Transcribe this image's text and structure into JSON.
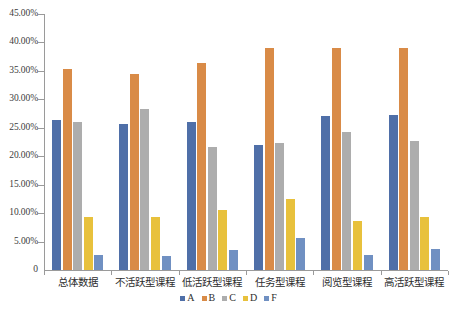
{
  "chart_data": {
    "type": "bar",
    "title": "",
    "subtitle": "",
    "xlabel": "",
    "ylabel": "",
    "ylim": [
      0,
      45
    ],
    "yunit": "%",
    "grid": false,
    "legend_position": "bottom",
    "categories": [
      "总体数据",
      "不活跃型课程",
      "低活跃型课程",
      "任务型课程",
      "阅览型课程",
      "高活跃型课程"
    ],
    "ytick_labels": [
      "45.00%",
      "40.00%",
      "35.00%",
      "30.00%",
      "25.00%",
      "20.00%",
      "15.00%",
      "10.00%",
      "5.00%",
      "0"
    ],
    "ytick_values": [
      45,
      40,
      35,
      30,
      25,
      20,
      15,
      10,
      5,
      0
    ],
    "series": [
      {
        "name": "A",
        "color": "#4F6FA8",
        "values": [
          26.4,
          25.7,
          26.1,
          22.0,
          27.1,
          27.3
        ]
      },
      {
        "name": "B",
        "color": "#D98B47",
        "values": [
          35.3,
          34.5,
          36.4,
          39.1,
          39.0,
          39.0
        ]
      },
      {
        "name": "C",
        "color": "#ADADAD",
        "values": [
          26.1,
          28.3,
          21.7,
          22.4,
          24.3,
          22.6
        ]
      },
      {
        "name": "D",
        "color": "#E8C13C",
        "values": [
          9.4,
          9.4,
          10.6,
          12.5,
          8.6,
          9.4
        ]
      },
      {
        "name": "F",
        "color": "#7090C2",
        "values": [
          2.7,
          2.5,
          3.5,
          5.6,
          2.7,
          3.7
        ]
      }
    ],
    "legend": [
      {
        "label": "A",
        "color": "#4F6FA8"
      },
      {
        "label": "B",
        "color": "#D98B47"
      },
      {
        "label": "C",
        "color": "#ADADAD"
      },
      {
        "label": "D",
        "color": "#E8C13C"
      },
      {
        "label": "F",
        "color": "#7090C2"
      }
    ]
  },
  "axis": {
    "y_max": 45,
    "y_min": 0
  }
}
